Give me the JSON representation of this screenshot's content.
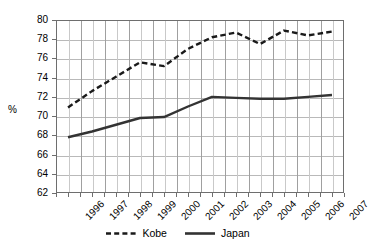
{
  "chart_data": {
    "type": "line",
    "title": "",
    "xlabel": "",
    "ylabel": "%",
    "categories": [
      "1996",
      "1997",
      "1998",
      "1999",
      "2000",
      "2001",
      "2002",
      "2003",
      "2004",
      "2005",
      "2006",
      "2007"
    ],
    "ylim": [
      62,
      80
    ],
    "ytick_step": 2,
    "yticks": [
      "80",
      "78",
      "76",
      "74",
      "72",
      "70",
      "68",
      "66",
      "64",
      "62"
    ],
    "grid": "both",
    "legend_position": "bottom",
    "series": [
      {
        "name": "Kobe",
        "style": "dashed",
        "color": "#1a1a1a",
        "values": [
          70.9,
          72.6,
          74.1,
          75.6,
          75.2,
          77.0,
          78.2,
          78.7,
          77.5,
          78.9,
          78.4,
          78.8
        ]
      },
      {
        "name": "Japan",
        "style": "solid",
        "color": "#333333",
        "values": [
          67.8,
          68.4,
          69.1,
          69.8,
          69.9,
          71.0,
          72.0,
          71.9,
          71.8,
          71.8,
          72.0,
          72.2
        ]
      }
    ]
  },
  "legend": {
    "items": [
      {
        "label": "Kobe"
      },
      {
        "label": "Japan"
      }
    ]
  }
}
